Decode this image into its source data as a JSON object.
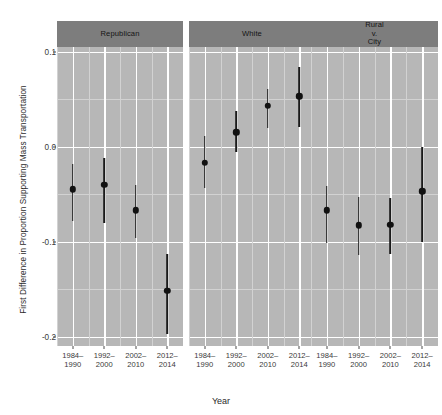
{
  "chart_data": {
    "type": "scatter",
    "title": "",
    "xlabel": "Year",
    "ylabel": "First Difference in Proportion Supporting Mass Transportation",
    "ylim": [
      -0.21,
      0.105
    ],
    "yticks": [
      "0.1",
      "0.0",
      "-0.1",
      "-0.2"
    ],
    "ytick_values": [
      0.1,
      0.0,
      -0.1,
      -0.2
    ],
    "y_minor_gridlines": [
      0.05,
      -0.05,
      -0.15
    ],
    "grid": true,
    "legend": "none",
    "categories": [
      "1984–\n1990",
      "1992–\n2000",
      "2002–\n2010",
      "2012–\n2014"
    ],
    "facet_titles": [
      "Republican",
      "White",
      "Rural\nv.\nCity"
    ],
    "panels": [
      {
        "facet": "Republican",
        "points": [
          {
            "x": "1984–1990",
            "estimate": -0.045,
            "lower": -0.078,
            "upper": -0.018
          },
          {
            "x": "1992–2000",
            "estimate": -0.04,
            "lower": -0.08,
            "upper": -0.012
          },
          {
            "x": "2002–2010",
            "estimate": -0.067,
            "lower": -0.096,
            "upper": -0.04
          },
          {
            "x": "2012–2014",
            "estimate": -0.152,
            "lower": -0.197,
            "upper": -0.113
          }
        ]
      },
      {
        "facet": "White",
        "points": [
          {
            "x": "1984–1990",
            "estimate": -0.017,
            "lower": -0.044,
            "upper": 0.011
          },
          {
            "x": "1992–2000",
            "estimate": 0.015,
            "lower": -0.006,
            "upper": 0.038
          },
          {
            "x": "2002–2010",
            "estimate": 0.043,
            "lower": 0.02,
            "upper": 0.061
          },
          {
            "x": "2012–2014",
            "estimate": 0.053,
            "lower": 0.021,
            "upper": 0.084
          }
        ]
      },
      {
        "facet": "Rural v. City",
        "points": [
          {
            "x": "1984–1990",
            "estimate": -0.067,
            "lower": -0.101,
            "upper": -0.041
          },
          {
            "x": "1992–2000",
            "estimate": -0.083,
            "lower": -0.114,
            "upper": -0.053
          },
          {
            "x": "2002–2010",
            "estimate": -0.082,
            "lower": -0.113,
            "upper": -0.054
          },
          {
            "x": "2012–2014",
            "estimate": -0.047,
            "lower": -0.1,
            "upper": 0.0
          }
        ]
      }
    ],
    "colors": {
      "panel_background": "#b7b7b7",
      "strip_background": "#7d7d7d",
      "gridline_major": "#ffffff",
      "gridline_minor": "#d2d2d2",
      "point": "#111111",
      "errorbar": "#1a1a1a",
      "plot_background": "#ffffff",
      "text": "#2b2b2b"
    }
  },
  "axes": {
    "y_title": "First Difference in Proportion Supporting Mass Transportation",
    "x_title": "Year"
  },
  "strips": [
    {
      "lines": [
        "Republican"
      ]
    },
    {
      "lines": [
        "White"
      ]
    },
    {
      "lines": [
        "Rural",
        "v.",
        "City"
      ]
    }
  ],
  "xticks": [
    {
      "line1": "1984–",
      "line2": "1990"
    },
    {
      "line1": "1992–",
      "line2": "2000"
    },
    {
      "line1": "2002–",
      "line2": "2010"
    },
    {
      "line1": "2012–",
      "line2": "2014"
    }
  ]
}
